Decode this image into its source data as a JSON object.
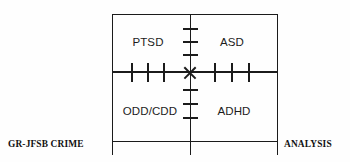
{
  "diagram": {
    "background_color": "#fefefe",
    "line_color": "#1b1b1b",
    "quadrants": [
      {
        "position": "top-left",
        "label": "PTSD"
      },
      {
        "position": "top-right",
        "label": "ASD"
      },
      {
        "position": "bottom-left",
        "label": "ODD/CDD"
      },
      {
        "position": "bottom-right",
        "label": "ADHD"
      }
    ],
    "center_marker": "x-cross-marker",
    "axis": {
      "ticks_up": 3,
      "ticks_down": 3,
      "ticks_left": 3,
      "ticks_right": 3
    }
  },
  "captions": {
    "left": "GR-JFSB CRIME",
    "right": "ANALYSIS"
  }
}
